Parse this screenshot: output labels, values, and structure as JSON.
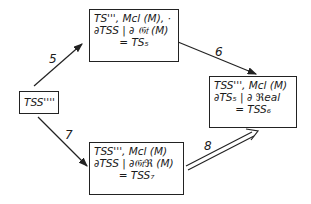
{
  "nodes": {
    "start": {
      "label": "TSS''''"
    },
    "ts5": {
      "lines": [
        "TS''', Mcl (M), ·",
        "∂TSS | ∂ 𝔊𝔱 (M)",
        "= TS₅"
      ]
    },
    "tss6": {
      "lines": [
        "TSS''', Mcl (M)",
        "∂TS₅ | ∂ ℜeal",
        "= TSS₆"
      ]
    },
    "tss7": {
      "lines": [
        "TSS''', Mcl (M)",
        "∂TSS | ∂𝔊𝔱ℜ (M)",
        "= TSS₇"
      ]
    }
  },
  "edges": {
    "e5": {
      "label": "5",
      "from": "start",
      "to": "ts5"
    },
    "e6": {
      "label": "6",
      "from": "ts5",
      "to": "tss6"
    },
    "e7": {
      "label": "7",
      "from": "start",
      "to": "tss7"
    },
    "e8": {
      "label": "8",
      "from": "tss7",
      "to": "tss6",
      "style": "double"
    }
  }
}
